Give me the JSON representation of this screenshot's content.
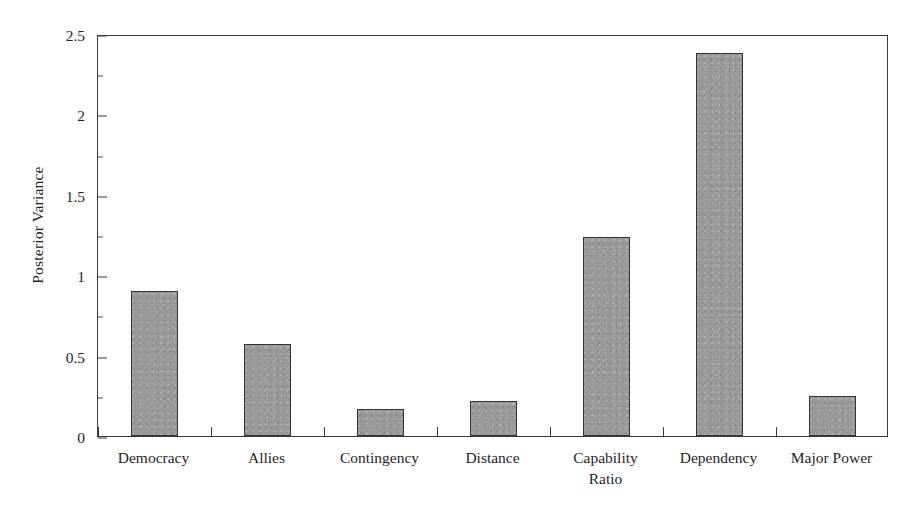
{
  "chart_data": {
    "type": "bar",
    "title": "",
    "subtitle": "",
    "xlabel": "",
    "ylabel": "Posterior Variance",
    "categories": [
      "Democracy",
      "Allies",
      "Contingency",
      "Distance",
      "Capability Ratio",
      "Dependency",
      "Major Power"
    ],
    "values": [
      0.9,
      0.57,
      0.17,
      0.22,
      1.24,
      2.38,
      0.25
    ],
    "ylim": [
      0,
      2.5
    ],
    "y_ticks": [
      0,
      0.5,
      1,
      1.5,
      2,
      2.5
    ],
    "y_tick_labels": [
      "0",
      "0.5",
      "1",
      "1.5",
      "2",
      "2.5"
    ],
    "y_minor_ticks": [
      0.25,
      0.75,
      1.25,
      1.75,
      2.25
    ],
    "grid": false,
    "legend": false,
    "legend_position": "none",
    "bar_fill_color": "#9a9a9a",
    "bar_edge_color": "#333333",
    "axis_color": "#3a3a3a",
    "background_color": "#ffffff"
  },
  "axis": {
    "y_title": "Posterior Variance",
    "tick_labels": [
      "2.5",
      "2",
      "1.5",
      "1",
      "0.5",
      "0"
    ]
  },
  "categories": [
    {
      "label": "Democracy",
      "line2": ""
    },
    {
      "label": "Allies",
      "line2": ""
    },
    {
      "label": "Contingency",
      "line2": ""
    },
    {
      "label": "Distance",
      "line2": ""
    },
    {
      "label": "Capability",
      "line2": "Ratio"
    },
    {
      "label": "Dependency",
      "line2": ""
    },
    {
      "label": "Major Power",
      "line2": ""
    }
  ]
}
